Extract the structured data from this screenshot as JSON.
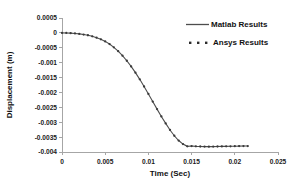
{
  "chart_data": {
    "type": "line",
    "title": "",
    "xlabel": "Time (Sec)",
    "ylabel": "Displacement (m)",
    "xlim": [
      0,
      0.025
    ],
    "ylim": [
      -0.004,
      0.0005
    ],
    "grid": false,
    "legend_position": "top-right",
    "xticks": [
      "0",
      "0.005",
      "0.01",
      "0.015",
      "0.02",
      "0.025"
    ],
    "xtick_values": [
      0,
      0.005,
      0.01,
      0.015,
      0.02,
      0.025
    ],
    "yticks": [
      "0.0005",
      "0",
      "-0.0005",
      "-0.001",
      "-0.0015",
      "-0.002",
      "-0.0025",
      "-0.003",
      "-0.0035",
      "-0.004"
    ],
    "ytick_values": [
      0.0005,
      0,
      -0.0005,
      -0.001,
      -0.0015,
      -0.002,
      -0.0025,
      -0.003,
      -0.0035,
      -0.004
    ],
    "series": [
      {
        "name": "Matlab Results",
        "style": "solid-line",
        "color": "#4d4d4d",
        "x": [
          0,
          0.0005,
          0.001,
          0.0015,
          0.002,
          0.0025,
          0.003,
          0.0035,
          0.004,
          0.0045,
          0.005,
          0.0055,
          0.006,
          0.0065,
          0.007,
          0.0075,
          0.008,
          0.0085,
          0.009,
          0.0095,
          0.01,
          0.0105,
          0.011,
          0.0115,
          0.012,
          0.0125,
          0.013,
          0.0135,
          0.014,
          0.0145,
          0.015,
          0.0155,
          0.016,
          0.0165,
          0.017,
          0.0175,
          0.018,
          0.0185,
          0.019,
          0.0195,
          0.02,
          0.0205,
          0.021,
          0.0215
        ],
        "values": [
          0,
          -2e-06,
          -8e-06,
          -1.9e-05,
          -3.4e-05,
          -5.5e-05,
          -8e-05,
          -0.000115,
          -0.00016,
          -0.000215,
          -0.000285,
          -0.000375,
          -0.000485,
          -0.000615,
          -0.000765,
          -0.000935,
          -0.001125,
          -0.001335,
          -0.00156,
          -0.0018,
          -0.00205,
          -0.002305,
          -0.00256,
          -0.002805,
          -0.00304,
          -0.00326,
          -0.003455,
          -0.003615,
          -0.003735,
          -0.00381,
          -0.0038,
          -0.00381,
          -0.003815,
          -0.003818,
          -0.00382,
          -0.003818,
          -0.003815,
          -0.003812,
          -0.00381,
          -0.003808,
          -0.003805,
          -0.003802,
          -0.0038,
          -0.0038
        ]
      },
      {
        "name": "Ansys Results",
        "style": "dot-markers",
        "color": "#3a3a3a",
        "x": [
          0,
          0.0005,
          0.001,
          0.0015,
          0.002,
          0.0025,
          0.003,
          0.0035,
          0.004,
          0.0045,
          0.005,
          0.0055,
          0.006,
          0.0065,
          0.007,
          0.0075,
          0.008,
          0.0085,
          0.009,
          0.0095,
          0.01,
          0.0105,
          0.011,
          0.0115,
          0.012,
          0.0125,
          0.013,
          0.0135,
          0.014,
          0.0145,
          0.015,
          0.0155,
          0.016,
          0.0165,
          0.017,
          0.0175,
          0.018,
          0.0185,
          0.019,
          0.0195,
          0.02,
          0.0205,
          0.021,
          0.0215
        ],
        "values": [
          0,
          -2e-06,
          -8e-06,
          -1.9e-05,
          -3.4e-05,
          -5.5e-05,
          -8e-05,
          -0.000115,
          -0.00016,
          -0.000215,
          -0.000285,
          -0.000375,
          -0.000485,
          -0.000615,
          -0.000765,
          -0.000935,
          -0.001125,
          -0.001335,
          -0.00156,
          -0.0018,
          -0.00205,
          -0.002305,
          -0.00256,
          -0.002805,
          -0.00304,
          -0.00326,
          -0.003455,
          -0.003615,
          -0.003735,
          -0.00381,
          -0.0038,
          -0.00381,
          -0.003815,
          -0.003818,
          -0.00382,
          -0.003818,
          -0.003815,
          -0.003812,
          -0.00381,
          -0.003808,
          -0.003805,
          -0.003802,
          -0.0038,
          -0.0038
        ]
      }
    ]
  },
  "legend": {
    "items": [
      {
        "label": "Matlab Results"
      },
      {
        "label": "Ansys Results"
      }
    ]
  }
}
